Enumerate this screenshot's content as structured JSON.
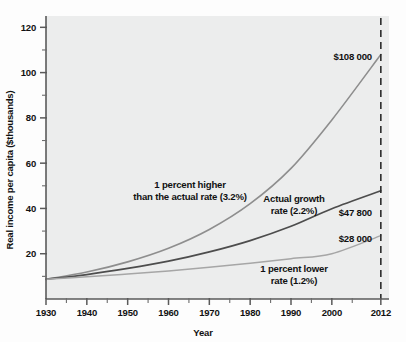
{
  "figure": {
    "background_color": "#fdfdfd",
    "plot_background_color": "#eceded"
  },
  "chart_data": {
    "type": "line",
    "title": "",
    "xlabel": "Year",
    "ylabel": "Real income per capita ($thousands)",
    "xlim": [
      1930,
      2014
    ],
    "ylim": [
      0,
      125
    ],
    "grid": false,
    "legend": "none (inline annotations)",
    "x_ticks_major": [
      1930,
      1940,
      1950,
      1960,
      1970,
      1980,
      1990,
      2000,
      2012
    ],
    "x_ticks_major_labels": [
      "1930",
      "1940",
      "1950",
      "1960",
      "1970",
      "1980",
      "1990",
      "2000",
      "2012"
    ],
    "x_ticks_minor": [
      1935,
      1945,
      1955,
      1965,
      1975,
      1985,
      1995,
      2005
    ],
    "y_ticks_major": [
      20,
      40,
      60,
      80,
      100,
      120
    ],
    "y_ticks_major_labels": [
      "20",
      "40",
      "60",
      "80",
      "100",
      "120"
    ],
    "y_ticks_minor": [
      10,
      30,
      50,
      70,
      90,
      110
    ],
    "start_year": 1930,
    "end_year": 2012,
    "start_value": 8.7,
    "reference_line": {
      "type": "vertical-dashed",
      "x": 2012,
      "label": "2012",
      "color": "#2c2c2c"
    },
    "series": [
      {
        "name": "1 percent higher than the actual rate (3.2%)",
        "rate_percent": 3.2,
        "color": "#8e8e8e",
        "stroke_width": 1.6,
        "end_value": 108.0,
        "end_label": "$108 000",
        "x": [
          1930,
          1940,
          1950,
          1960,
          1970,
          1980,
          1990,
          2000,
          2012
        ],
        "values": [
          8.7,
          11.9,
          16.4,
          22.4,
          30.7,
          42.1,
          57.7,
          79.1,
          108.0
        ]
      },
      {
        "name": "Actual growth rate (2.2%)",
        "rate_percent": 2.2,
        "color": "#4d4d4d",
        "stroke_width": 1.7,
        "end_value": 47.8,
        "end_label": "$47 800",
        "x": [
          1930,
          1940,
          1950,
          1960,
          1970,
          1980,
          1990,
          2000,
          2012
        ],
        "values": [
          8.7,
          10.8,
          13.5,
          16.7,
          20.8,
          25.8,
          32.1,
          39.9,
          47.8
        ]
      },
      {
        "name": "1 percent lower rate (1.2%)",
        "rate_percent": 1.2,
        "color": "#a6a6a6",
        "stroke_width": 1.5,
        "end_value": 28.0,
        "end_label": "$28 000",
        "x": [
          1930,
          1940,
          1950,
          1960,
          1970,
          1980,
          1990,
          2000,
          2012
        ],
        "values": [
          8.7,
          9.8,
          11.0,
          12.4,
          14.0,
          15.8,
          17.8,
          20.0,
          28.0
        ]
      }
    ],
    "annotations": [
      {
        "id": "higher-rate-annotation",
        "line1": "1 percent higher",
        "line2": "than the actual rate (3.2%)",
        "x_px": 190,
        "y_px": 188
      },
      {
        "id": "actual-rate-annotation",
        "line1": "Actual growth",
        "line2": "rate (2.2%)",
        "x_px": 294,
        "y_px": 202
      },
      {
        "id": "lower-rate-annotation",
        "line1": "1 percent lower",
        "line2": "rate (1.2%)",
        "x_px": 294,
        "y_px": 272
      }
    ],
    "end_labels": [
      {
        "id": "end-label-high",
        "text": "$108 000",
        "x_px": 372,
        "y_px": 60
      },
      {
        "id": "end-label-actual",
        "text": "$47 800",
        "x_px": 372,
        "y_px": 216
      },
      {
        "id": "end-label-low",
        "text": "$28 000",
        "x_px": 372,
        "y_px": 242
      }
    ]
  }
}
